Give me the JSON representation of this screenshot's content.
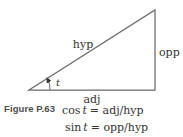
{
  "figure": {
    "caption": "Figure P.63",
    "labels": {
      "hyp": "hyp",
      "opp": "opp",
      "adj": "adj",
      "angle": "t"
    },
    "equations": [
      {
        "func": "cos",
        "var": "t",
        "rhs": "= adj/hyp"
      },
      {
        "func": "sin",
        "var": "t",
        "rhs": "= opp/hyp"
      }
    ],
    "colors": {
      "line": "#6b6b6b",
      "text": "#333333",
      "caption": "#4f4f4f"
    }
  }
}
